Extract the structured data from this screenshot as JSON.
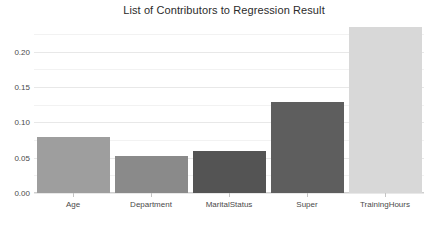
{
  "chart_data": {
    "type": "bar",
    "title": "List of Contributors to Regression Result",
    "xlabel": "",
    "ylabel": "",
    "categories": [
      "Age",
      "Department",
      "MaritalStatus",
      "Super",
      "TrainingHours"
    ],
    "values": [
      0.08,
      0.052,
      0.06,
      0.129,
      0.235
    ],
    "ylim": [
      0.0,
      0.245
    ],
    "yticks": [
      0.0,
      0.05,
      0.1,
      0.15,
      0.2
    ],
    "ytick_labels": [
      "0.00",
      "0.05",
      "0.10",
      "0.15",
      "0.20"
    ],
    "grid": true,
    "legend": "none",
    "bar_colors": [
      "#9e9e9e",
      "#8a8a8a",
      "#545454",
      "#5e5e5e",
      "#d8d8d8"
    ],
    "background": "#ffffff",
    "gridline_color": "#e8e8e8",
    "axis_text_color": "#4a4a4a",
    "title_color": "#2b2b2b"
  }
}
